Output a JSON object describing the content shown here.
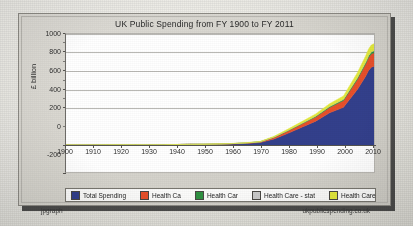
{
  "chart": {
    "title": "UK Public Spending from FY 1900 to FY 2011",
    "ylabel": "£ billion",
    "footer_left": "jpgraph",
    "footer_right": "ukpublicspending.co.uk"
  },
  "legend": {
    "items": [
      {
        "label": "Total Spending",
        "color": "#33408c"
      },
      {
        "label": "Health Ca",
        "color": "#e8502a"
      },
      {
        "label": "Health Car",
        "color": "#2f9141"
      },
      {
        "label": "Health Care - stat",
        "color": "#c9c9c9"
      },
      {
        "label": "Health Care",
        "color": "#e4ea3c"
      }
    ]
  },
  "chart_data": {
    "type": "area",
    "title": "UK Public Spending from FY 1900 to FY 2011",
    "xlabel": "",
    "ylabel": "£ billion",
    "xlim": [
      1900,
      2011
    ],
    "ylim": [
      -200,
      1000
    ],
    "yticks": [
      1000,
      800,
      600,
      400,
      200,
      0,
      -200
    ],
    "xticks": [
      1900,
      1910,
      1920,
      1930,
      1940,
      1950,
      1960,
      1970,
      1980,
      1990,
      2000,
      2010
    ],
    "grid": true,
    "legend_position": "bottom",
    "stacked": true,
    "x": [
      1900,
      1905,
      1910,
      1915,
      1920,
      1925,
      1930,
      1935,
      1940,
      1945,
      1950,
      1955,
      1960,
      1965,
      1970,
      1975,
      1980,
      1985,
      1990,
      1995,
      2000,
      2005,
      2008,
      2009,
      2010,
      2011
    ],
    "series": [
      {
        "name": "Total Spending",
        "color": "#33408c",
        "values": [
          0.3,
          0.3,
          0.4,
          1.5,
          2.0,
          1.3,
          1.3,
          1.4,
          4.5,
          6.0,
          4.5,
          6.0,
          9.0,
          14.0,
          22.0,
          55.0,
          105.0,
          160.0,
          215.0,
          290.0,
          340.0,
          500.0,
          620.0,
          670.0,
          700.0,
          710.0
        ]
      },
      {
        "name": "Health Ca",
        "color": "#e8502a",
        "values": [
          0,
          0,
          0,
          0,
          0,
          0,
          0,
          0,
          0,
          0,
          2.0,
          2.5,
          3.0,
          4.0,
          6.0,
          14.0,
          22.0,
          30.0,
          38.0,
          48.0,
          60.0,
          90.0,
          110.0,
          115.0,
          120.0,
          120.0
        ]
      },
      {
        "name": "Health Car",
        "color": "#2f9141",
        "values": [
          0,
          0,
          0,
          0,
          0,
          0,
          0,
          0,
          0,
          0,
          0.5,
          0.5,
          0.8,
          1.0,
          1.5,
          3.0,
          5.0,
          6.0,
          8.0,
          10.0,
          12.0,
          16.0,
          18.0,
          19.0,
          20.0,
          20.0
        ]
      },
      {
        "name": "Health Care - stat",
        "color": "#c9c9c9",
        "values": [
          0,
          0,
          0,
          0,
          0,
          0,
          0,
          0,
          0,
          0,
          0,
          0,
          0,
          0,
          0,
          0,
          0,
          0,
          0,
          0,
          0,
          0,
          0,
          0,
          0,
          0
        ]
      },
      {
        "name": "Health Care",
        "color": "#e4ea3c",
        "values": [
          0,
          0,
          0,
          0,
          0,
          0,
          0,
          0,
          0,
          0,
          1.0,
          1.2,
          1.5,
          2.0,
          3.0,
          7.0,
          11.0,
          15.0,
          19.0,
          24.0,
          30.0,
          45.0,
          55.0,
          58.0,
          60.0,
          62.0
        ]
      }
    ],
    "totals_note": "Stacked total reaches approximately 960 in 2011"
  }
}
